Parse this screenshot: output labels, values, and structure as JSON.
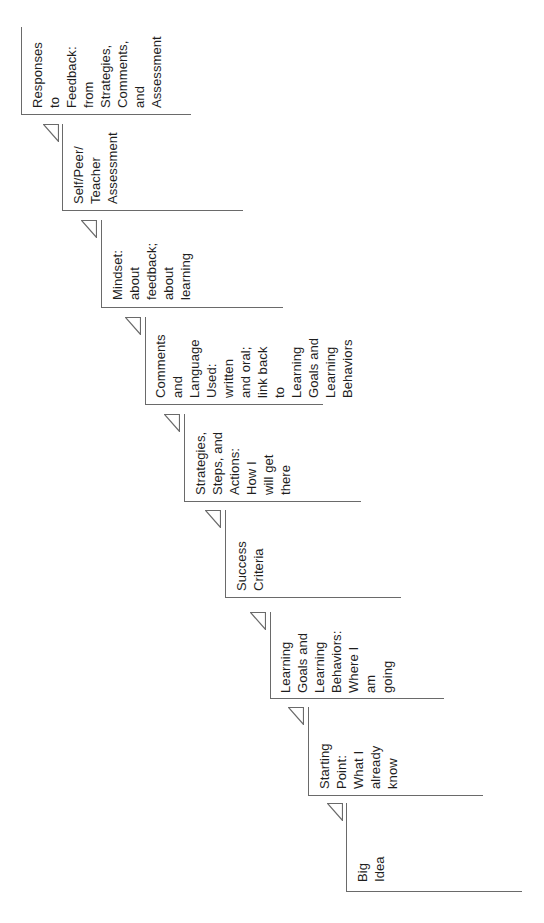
{
  "diagram": {
    "type": "staircase",
    "orientation": "rotated-90-ccw",
    "line_color": "#6a6a6a",
    "text_color": "#1e1e1e",
    "steps": [
      {
        "order": 1,
        "label": "Big Idea"
      },
      {
        "order": 2,
        "label": "Starting Point:\nWhat I already\nknow"
      },
      {
        "order": 3,
        "label": "Learning\nGoals and\nLearning\nBehaviors:\nWhere I am\ngoing"
      },
      {
        "order": 4,
        "label": "Success\nCriteria"
      },
      {
        "order": 5,
        "label": "Strategies,\nSteps, and\nActions: How I\nwill get there"
      },
      {
        "order": 6,
        "label": "Comments\nand Language\nUsed: written\nand oral;\nlink back to\nLearning\nGoals and\nLearning\nBehaviors"
      },
      {
        "order": 7,
        "label": "Mindset:\nabout\nfeedback;\nabout\nlearning"
      },
      {
        "order": 8,
        "label": "Self/Peer/\nTeacher\nAssessment"
      },
      {
        "order": 9,
        "label": "Responses\nto Feedback:\nfrom\nStrategies,\nComments,\nand\nAssessment"
      }
    ]
  }
}
